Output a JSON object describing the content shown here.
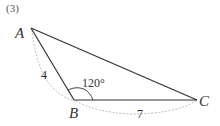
{
  "problem": {
    "label": "(3)"
  },
  "triangle": {
    "vertices": [
      {
        "name": "A",
        "x": 31,
        "y": 28
      },
      {
        "name": "B",
        "x": 74,
        "y": 100
      },
      {
        "name": "C",
        "x": 197,
        "y": 100
      }
    ],
    "labels": {
      "A": "A",
      "B": "B",
      "C": "C"
    },
    "sides": {
      "AB": "4",
      "BC": "7"
    },
    "angle_B": "120°"
  },
  "colors": {
    "line": "#333333",
    "dashed": "#999999",
    "text": "#333333"
  }
}
